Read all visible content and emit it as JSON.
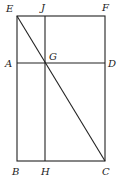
{
  "diagram": {
    "type": "geometry-figure",
    "stroke_color": "#222222",
    "points": {
      "E": {
        "label": "E",
        "x": 17,
        "y": 16
      },
      "J": {
        "label": "J",
        "x": 45,
        "y": 16
      },
      "F": {
        "label": "F",
        "x": 105,
        "y": 16
      },
      "A": {
        "label": "A",
        "x": 17,
        "y": 63
      },
      "G": {
        "label": "G",
        "x": 45,
        "y": 63
      },
      "D": {
        "label": "D",
        "x": 105,
        "y": 63
      },
      "B": {
        "label": "B",
        "x": 17,
        "y": 161
      },
      "H": {
        "label": "H",
        "x": 45,
        "y": 161
      },
      "C": {
        "label": "C",
        "x": 105,
        "y": 161
      }
    },
    "segments": [
      {
        "from": "E",
        "to": "F"
      },
      {
        "from": "F",
        "to": "C"
      },
      {
        "from": "C",
        "to": "B"
      },
      {
        "from": "B",
        "to": "E"
      },
      {
        "from": "J",
        "to": "H"
      },
      {
        "from": "A",
        "to": "D"
      },
      {
        "from": "E",
        "to": "C"
      }
    ]
  }
}
